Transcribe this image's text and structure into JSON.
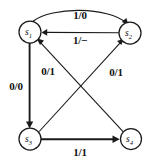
{
  "diagram": {
    "type": "mealy-state-machine",
    "canvas": {
      "width": 155,
      "height": 166
    },
    "colors": {
      "background": "#ffffff",
      "stroke": "#1a1a1a",
      "text": "#111111"
    },
    "nodes": [
      {
        "id": "s1",
        "label": "s",
        "subscript": "1",
        "cx": 30,
        "cy": 32,
        "r": 11
      },
      {
        "id": "s2",
        "label": "s",
        "subscript": "2",
        "cx": 130,
        "cy": 33,
        "r": 11
      },
      {
        "id": "s3",
        "label": "s",
        "subscript": "3",
        "cx": 30,
        "cy": 139,
        "r": 11
      },
      {
        "id": "s4",
        "label": "s",
        "subscript": "4",
        "cx": 131,
        "cy": 139,
        "r": 10.5
      }
    ],
    "edges": [
      {
        "id": "e-s1-s2-top",
        "from": "s1",
        "to": "s2",
        "label": "1/0",
        "shape": "arc",
        "label_x": 80,
        "label_y": 16
      },
      {
        "id": "e-s2-s1",
        "from": "s2",
        "to": "s1",
        "label": "1/−",
        "shape": "straight",
        "label_x": 80,
        "label_y": 41
      },
      {
        "id": "e-s1-s3",
        "from": "s1",
        "to": "s3",
        "label": "0/0",
        "shape": "straight",
        "label_x": 16,
        "label_y": 87
      },
      {
        "id": "e-s3-s4",
        "from": "s3",
        "to": "s4",
        "label": "1/1",
        "shape": "straight",
        "label_x": 80,
        "label_y": 153
      },
      {
        "id": "e-s3-s2",
        "from": "s3",
        "to": "s2",
        "label": "0/1",
        "shape": "diagonal",
        "label_x": 116,
        "label_y": 73
      },
      {
        "id": "e-s4-s1",
        "from": "s4",
        "to": "s1",
        "label": "0/1",
        "shape": "diagonal",
        "label_x": 48,
        "label_y": 72
      }
    ]
  }
}
